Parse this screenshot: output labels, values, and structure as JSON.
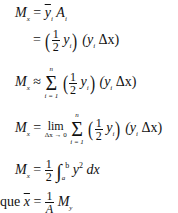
{
  "equations": {
    "line1": {
      "lhs": "M",
      "lhs_sub": "x",
      "lhs_subsub": "i",
      "op": "=",
      "ybar": "y",
      "ybar_sub": "i",
      "A": "A",
      "A_sub": "i"
    },
    "line2": {
      "op": "=",
      "frac_num": "1",
      "frac_den": "2",
      "y": "y",
      "y_sub": "i",
      "term": "(y",
      "term_sub": "i",
      "term_end": "Δx)"
    },
    "line3": {
      "lhs": "M",
      "lhs_sub": "x",
      "op": "≈",
      "sum": "Σ",
      "sum_lo": "i = 1",
      "sum_hi": "n",
      "frac_num": "1",
      "frac_den": "2",
      "y": "y",
      "y_sub": "i",
      "term": "(y",
      "term_sub": "i",
      "term_end": "Δx)"
    },
    "line4": {
      "lhs": "M",
      "lhs_sub": "x",
      "op": "=",
      "lim": "lim",
      "lim_lo": "Δx → 0",
      "sum": "Σ",
      "sum_lo": "i = 1",
      "sum_hi": "n",
      "frac_num": "1",
      "frac_den": "2",
      "y": "y",
      "y_sub": "i",
      "term": "(y",
      "term_sub": "i",
      "term_end": "Δx)"
    },
    "line5": {
      "lhs": "M",
      "lhs_sub": "x",
      "op": "=",
      "frac_num": "1",
      "frac_den": "2",
      "int": "∫",
      "int_lo": "a",
      "int_hi": "b",
      "integrand": "y",
      "power": "2",
      "dx": "dx"
    },
    "line6": {
      "prefix": "que",
      "xbar": "x",
      "op": "=",
      "frac_num": "1",
      "frac_den": "A",
      "M": "M",
      "M_sub": "y"
    }
  }
}
